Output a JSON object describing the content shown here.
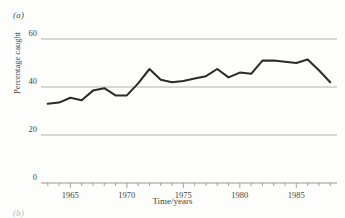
{
  "figure": {
    "panel_label": "(a)",
    "next_panel_label": "(b)"
  },
  "chart_data": {
    "type": "line",
    "title": "",
    "xlabel": "Time/years",
    "ylabel": "Percentage caught",
    "xlim": [
      1962.4,
      1988.6
    ],
    "ylim": [
      0,
      62
    ],
    "grid": true,
    "legend": "none",
    "ytick_labels": [
      "0",
      "20",
      "40",
      "60"
    ],
    "yticks": [
      0,
      20,
      40,
      60
    ],
    "xtick_labels": [
      "1965",
      "1970",
      "1975",
      "1980",
      "1985"
    ],
    "xticks": [
      1965,
      1970,
      1975,
      1980,
      1985
    ],
    "minor_xticks_every": 1,
    "line_color": "#2b2b29",
    "grid_color": "#a9a9a6",
    "x": [
      1963,
      1964,
      1965,
      1966,
      1967,
      1968,
      1969,
      1970,
      1971,
      1972,
      1973,
      1974,
      1975,
      1976,
      1977,
      1978,
      1979,
      1980,
      1981,
      1982,
      1983,
      1984,
      1985,
      1986,
      1987,
      1988
    ],
    "values": [
      33,
      33.5,
      35.5,
      34.5,
      38.5,
      39.5,
      36.5,
      36.5,
      41.5,
      47.5,
      43,
      42,
      42.5,
      43.5,
      44.5,
      47.5,
      44,
      46,
      45.5,
      51,
      51,
      50.5,
      50,
      51.5,
      47,
      42
    ]
  }
}
